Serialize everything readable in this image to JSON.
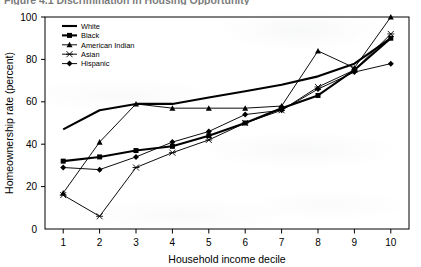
{
  "figure": {
    "caption_partial": "Figure 4.1  Discrimination in Housing Opportunity",
    "caption_visible": "clipped"
  },
  "chart_data": {
    "type": "line",
    "title": "",
    "xlabel": "Household income decile",
    "ylabel": "Homeownership rate (percent)",
    "x": [
      1,
      2,
      3,
      4,
      5,
      6,
      7,
      8,
      9,
      10
    ],
    "xlim": [
      0.5,
      10.5
    ],
    "ylim": [
      0,
      100
    ],
    "yticks": [
      0,
      20,
      40,
      60,
      80,
      100
    ],
    "xticks": [
      1,
      2,
      3,
      4,
      5,
      6,
      7,
      8,
      9,
      10
    ],
    "grid": false,
    "legend_position": "top-left inside",
    "series": [
      {
        "name": "White",
        "marker": "none",
        "linewidth": "thick",
        "values": [
          47,
          56,
          59,
          59,
          62,
          65,
          68,
          72,
          78,
          90
        ]
      },
      {
        "name": "Black",
        "marker": "filled-square",
        "linewidth": "thick",
        "values": [
          32,
          34,
          37,
          39,
          44,
          50,
          57,
          63,
          75,
          90
        ]
      },
      {
        "name": "American Indian",
        "marker": "filled-triangle",
        "linewidth": "thin",
        "values": [
          17,
          41,
          59,
          57,
          57,
          57,
          58,
          84,
          76,
          100
        ]
      },
      {
        "name": "Asian",
        "marker": "asterisk",
        "linewidth": "thin",
        "values": [
          16,
          6,
          29,
          36,
          42,
          50,
          56,
          67,
          75,
          92
        ]
      },
      {
        "name": "Hispanic",
        "marker": "filled-diamond",
        "linewidth": "thin",
        "values": [
          29,
          28,
          34,
          41,
          46,
          54,
          56,
          66,
          74,
          78
        ]
      }
    ]
  }
}
